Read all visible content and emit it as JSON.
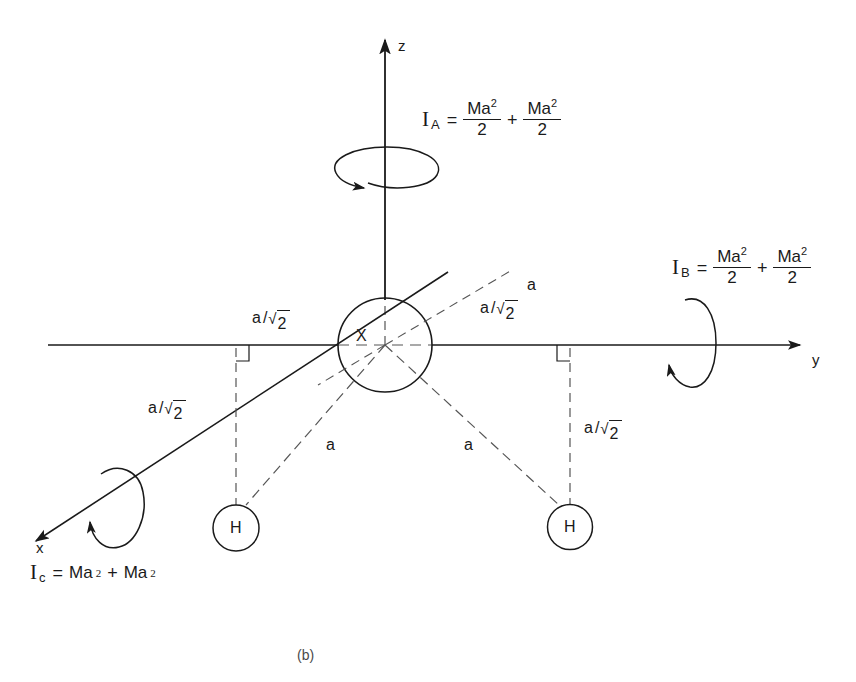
{
  "figure": {
    "caption": "(b)",
    "center_atom": "X",
    "hydrogen_left": "H",
    "hydrogen_right": "H"
  },
  "axes": {
    "z": {
      "label": "z"
    },
    "y": {
      "label": "y"
    },
    "x": {
      "label": "x"
    }
  },
  "moments": {
    "IA": {
      "symbol": "I",
      "subscript": "A",
      "equals": "=",
      "term1_num": "Ma",
      "term1_exp": "2",
      "term1_den": "2",
      "operator": "+",
      "term2_num": "Ma",
      "term2_exp": "2",
      "term2_den": "2"
    },
    "IB": {
      "symbol": "I",
      "subscript": "B",
      "equals": "=",
      "term1_num": "Ma",
      "term1_exp": "2",
      "term1_den": "2",
      "operator": "+",
      "term2_num": "Ma",
      "term2_exp": "2",
      "term2_den": "2"
    },
    "IC": {
      "symbol": "I",
      "subscript": "c",
      "equals": "=",
      "term1": "Ma",
      "term1_exp": "2",
      "operator": "+",
      "term2": "Ma",
      "term2_exp": "2"
    }
  },
  "distances": {
    "a_over_root2_top_left": {
      "lead": "a",
      "slash": "/",
      "tick": "√",
      "radicand": "2"
    },
    "a_over_root2_top_right": {
      "lead": "a",
      "slash": "/",
      "tick": "√",
      "radicand": "2"
    },
    "a_over_root2_mid_left": {
      "lead": "a",
      "slash": "/",
      "tick": "√",
      "radicand": "2"
    },
    "a_over_root2_mid_right": {
      "lead": "a",
      "slash": "/",
      "tick": "√",
      "radicand": "2"
    },
    "bond_left": "a",
    "bond_right": "a",
    "radius_upper_right": "a",
    "radius_lower_left": "a",
    "radius_lower_right": "a"
  },
  "colors": {
    "ink": "#1a1a1a",
    "dash": "#555555",
    "background": "#ffffff"
  }
}
